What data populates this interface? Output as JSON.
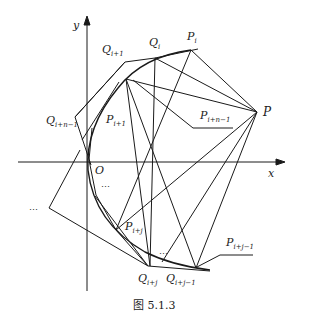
{
  "figure": {
    "caption": "图 5.1.3",
    "axes": {
      "x_label": "x",
      "y_label": "y",
      "origin_label": "O"
    },
    "points": {
      "P": "P",
      "P_i": {
        "base": "P",
        "sub": "i"
      },
      "Q_i": {
        "base": "Q",
        "sub": "i"
      },
      "Q_i1": {
        "base": "Q",
        "sub": "i+1"
      },
      "P_i1": {
        "base": "P",
        "sub": "i+1"
      },
      "Q_in1": {
        "base": "Q",
        "sub": "i+n−1"
      },
      "P_in1": {
        "base": "P",
        "sub": "i+n−1"
      },
      "P_ij": {
        "base": "P",
        "sub": "i+j"
      },
      "Q_ij": {
        "base": "Q",
        "sub": "i+j"
      },
      "Q_ij1": {
        "base": "Q",
        "sub": "i+j−1"
      },
      "P_ij1": {
        "base": "P",
        "sub": "i+j−1"
      }
    },
    "ellipsis": [
      "…",
      "…",
      "…"
    ],
    "colors": {
      "stroke": "#1a1a1a",
      "background": "#ffffff"
    }
  }
}
